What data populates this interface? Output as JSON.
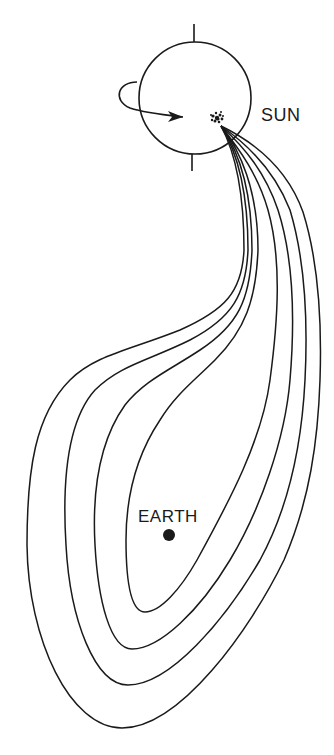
{
  "diagram": {
    "type": "magnetic field line loops from solar active region enveloping Earth",
    "stroke_color": "#1a1a1a",
    "background": "#ffffff",
    "labels": {
      "sun": "SUN",
      "earth": "EARTH"
    },
    "sun": {
      "cx": 195,
      "cy": 98,
      "r": 56,
      "axis_top": {
        "x": 194,
        "y1": 24,
        "y2": 42
      },
      "axis_bottom": {
        "x": 192,
        "y1": 154,
        "y2": 171
      },
      "rotation_arrow_path": "M 137 82 C 118 82, 112 100, 130 108 C 145 113, 165 115, 183 117",
      "arrowhead_points": "183,117 168,111 172,117 168,122",
      "active_region": {
        "cx": 217,
        "cy": 118,
        "r": 7
      }
    },
    "earth": {
      "cx": 169,
      "cy": 535,
      "r": 6
    },
    "field_loops": [
      {
        "name": "loop-1-inner",
        "path": "M 221 126 C 240 150, 258 190, 258 250 C 256 300, 245 330, 215 360 C 195 380, 175 395, 160 420 C 140 450, 126 490, 126 540 C 126 580, 130 612, 145 612 C 160 612, 180 590, 197 560 C 230 500, 262 440, 270 380 C 278 320, 282 260, 268 210 C 258 175, 240 150, 221 126"
      },
      {
        "name": "loop-2",
        "path": "M 221 126 C 238 150, 252 190, 252 250 C 250 300, 238 325, 200 350 C 170 370, 145 380, 125 405 C 100 440, 92 490, 95 545 C 98 600, 110 649, 132 649 C 160 649, 200 610, 230 560 C 260 510, 285 440, 290 380 C 295 320, 294 260, 278 210 C 265 172, 245 148, 221 126"
      },
      {
        "name": "loop-3",
        "path": "M 221 126 C 236 150, 248 190, 248 250 C 246 295, 232 318, 190 340 C 150 360, 120 365, 95 390 C 68 420, 62 480, 66 545 C 70 620, 95 685, 128 685 C 170 685, 225 620, 260 560 C 290 505, 302 440, 305 380 C 308 320, 305 260, 290 210 C 275 172, 250 146, 221 126"
      },
      {
        "name": "loop-4-outer",
        "path": "M 221 126 C 234 150, 244 190, 244 250 C 242 292, 225 310, 180 330 C 130 350, 95 355, 70 380 C 35 415, 27 470, 27 545 C 28 640, 70 728, 122 728 C 180 728, 250 630, 284 560 C 310 500, 318 440, 320 380 C 322 320, 318 260, 303 212 C 288 170, 258 144, 221 126"
      }
    ]
  }
}
